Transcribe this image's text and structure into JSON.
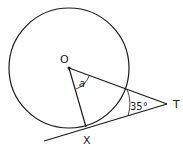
{
  "diagram": {
    "type": "circle-tangent-geometry",
    "points": {
      "O": {
        "label": "O",
        "x": 69,
        "y": 68
      },
      "X": {
        "label": "X",
        "x": 86,
        "y": 127
      },
      "T": {
        "label": "T",
        "x": 167,
        "y": 104
      }
    },
    "circle": {
      "cx": 69,
      "cy": 68,
      "r": 60
    },
    "angles": {
      "at_O": {
        "label": "a"
      },
      "at_T": {
        "label": "35°"
      }
    },
    "colors": {
      "stroke": "#1a1a1a",
      "background": "#ffffff"
    }
  }
}
